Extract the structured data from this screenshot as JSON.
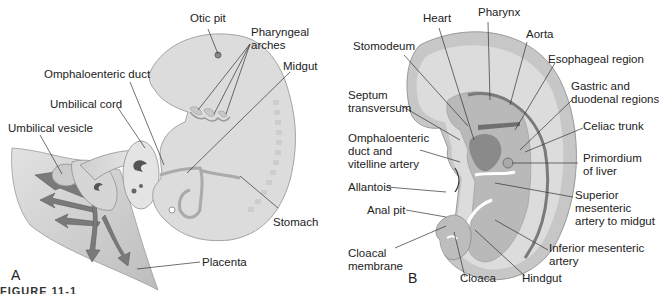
{
  "panels": [
    {
      "id": "A",
      "letter": "A",
      "labels": {
        "otic_pit": "Otic pit",
        "pharyngeal_arches": "Pharyngeal\narches",
        "omphaloenteric_duct": "Omphaloenteric duct",
        "midgut": "Midgut",
        "umbilical_cord": "Umbilical cord",
        "umbilical_vesicle": "Umbilical vesicle",
        "stomach": "Stomach",
        "placenta": "Placenta"
      }
    },
    {
      "id": "B",
      "letter": "B",
      "labels": {
        "heart": "Heart",
        "pharynx": "Pharynx",
        "aorta": "Aorta",
        "stomodeum": "Stomodeum",
        "esophageal_region": "Esophageal region",
        "gastric_duodenal": "Gastric and\nduodenal regions",
        "septum_transversum": "Septum\ntransversum",
        "celiac_trunk": "Celiac trunk",
        "omphaloenteric_vitelline": "Omphaloenteric\nduct and\nvitelline artery",
        "primordium_liver": "Primordium\nof liver",
        "allantois": "Allantois",
        "superior_mesenteric": "Superior\nmesenteric\nartery to midgut",
        "anal_pit": "Anal pit",
        "inferior_mesenteric": "Inferior mesenteric\nartery",
        "cloacal_membrane": "Cloacal\nmembrane",
        "cloaca": "Cloaca",
        "hindgut": "Hindgut"
      }
    }
  ],
  "caption_fragment": "FIGURE 11-1",
  "colors": {
    "embryo_fill": "#d9d9d9",
    "embryo_edge": "#a8a8a8",
    "dark_tissue": "#6e6e6e",
    "mid_tissue": "#b5b5b5",
    "placenta_fill": "#cfcfcf",
    "leader_line": "#333333"
  }
}
